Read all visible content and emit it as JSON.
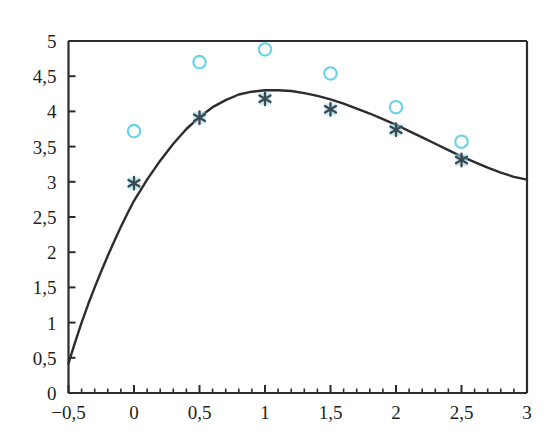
{
  "chart_data": {
    "type": "scatter",
    "title": "",
    "xlabel": "",
    "ylabel": "",
    "xlim": [
      -0.5,
      3
    ],
    "ylim": [
      0,
      5
    ],
    "grid": false,
    "legend_position": "none",
    "decimal_separator": ",",
    "x_ticks": [
      -0.5,
      0,
      0.5,
      1,
      1.5,
      2,
      2.5,
      3
    ],
    "x_tick_labels": [
      "−0,5",
      "0",
      "0,5",
      "1",
      "1,5",
      "2",
      "2,5",
      "3"
    ],
    "x_minor_tick_step": 0.1,
    "y_ticks": [
      0,
      0.5,
      1,
      1.5,
      2,
      2.5,
      3,
      3.5,
      4,
      4.5,
      5
    ],
    "y_tick_labels": [
      "0",
      "0,5",
      "1",
      "1,5",
      "2",
      "2,5",
      "3",
      "3,5",
      "4",
      "4,5",
      "5"
    ],
    "series": [
      {
        "name": "fitted-curve",
        "type": "line",
        "color": "#2b2b30",
        "x": [
          -0.5,
          -0.45,
          -0.4,
          -0.35,
          -0.3,
          -0.25,
          -0.2,
          -0.15,
          -0.1,
          -0.05,
          0,
          0.1,
          0.2,
          0.3,
          0.4,
          0.5,
          0.6,
          0.7,
          0.8,
          0.9,
          1.0,
          1.1,
          1.2,
          1.3,
          1.4,
          1.5,
          1.6,
          1.7,
          1.8,
          1.9,
          2.0,
          2.1,
          2.2,
          2.3,
          2.4,
          2.5,
          2.6,
          2.7,
          2.8,
          2.9,
          3.0
        ],
        "y": [
          0.42,
          0.72,
          1.0,
          1.26,
          1.5,
          1.73,
          1.95,
          2.16,
          2.36,
          2.55,
          2.73,
          3.03,
          3.3,
          3.54,
          3.75,
          3.92,
          4.06,
          4.16,
          4.24,
          4.28,
          4.3,
          4.3,
          4.29,
          4.26,
          4.22,
          4.17,
          4.11,
          4.04,
          3.97,
          3.89,
          3.81,
          3.72,
          3.63,
          3.54,
          3.45,
          3.36,
          3.28,
          3.2,
          3.13,
          3.07,
          3.03
        ]
      },
      {
        "name": "open-circle-points",
        "type": "scatter",
        "marker": "circle-open",
        "color": "#66d3e8",
        "x": [
          0,
          0.5,
          1,
          1.5,
          2,
          2.5
        ],
        "y": [
          3.72,
          4.7,
          4.88,
          4.54,
          4.06,
          3.57
        ]
      },
      {
        "name": "star-points",
        "type": "scatter",
        "marker": "star",
        "color": "#3c4850",
        "halo_color": "#8fdcee",
        "x": [
          0,
          0.5,
          1,
          1.5,
          2,
          2.5
        ],
        "y": [
          2.98,
          3.91,
          4.18,
          4.03,
          3.74,
          3.31
        ]
      }
    ]
  },
  "axes": {
    "frame_color": "#2b2b30",
    "background": "#ffffff"
  }
}
